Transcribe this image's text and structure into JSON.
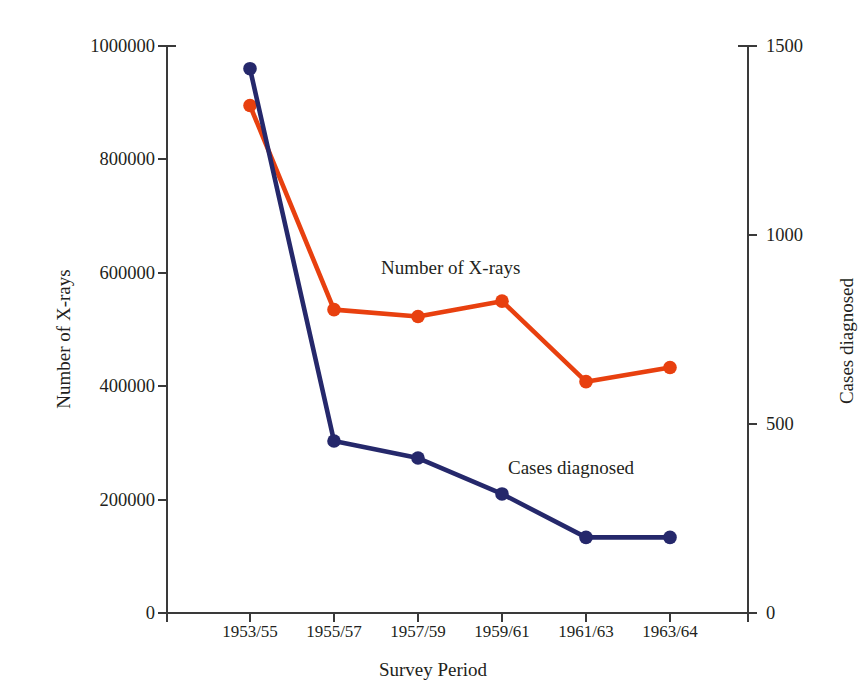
{
  "chart_data": {
    "type": "line",
    "title": "",
    "xlabel": "Survey Period",
    "ylabel": "Number of X-rays",
    "y2label": "Cases diagnosed",
    "categories": [
      "1953/55",
      "1955/57",
      "1957/59",
      "1959/61",
      "1961/63",
      "1963/64"
    ],
    "ylim": [
      0,
      1000000
    ],
    "y2lim": [
      0,
      1500
    ],
    "yticks": [
      "0",
      "200000",
      "400000",
      "600000",
      "800000",
      "1000000"
    ],
    "ytick_values": [
      0,
      200000,
      400000,
      600000,
      800000,
      1000000
    ],
    "y2ticks": [
      "0",
      "500",
      "1000",
      "1500"
    ],
    "y2tick_values": [
      0,
      500,
      1000,
      1500
    ],
    "grid": false,
    "legend": "inline-annotations",
    "series": [
      {
        "name": "Number of X-rays",
        "axis": "left",
        "color": "#e8400f",
        "label_text": "Number of X-rays",
        "values": [
          895000,
          535000,
          523000,
          550000,
          408000,
          433000
        ]
      },
      {
        "name": "Cases diagnosed",
        "axis": "right",
        "color": "#25286b",
        "label_text": "Cases diagnosed",
        "values": [
          1440,
          455,
          410,
          315,
          200,
          200
        ]
      }
    ]
  },
  "axes": {
    "left_title": "Number of X-rays",
    "right_title": "Cases diagnosed",
    "bottom_title": "Survey Period"
  },
  "colors": {
    "xrays": "#e8400f",
    "cases": "#25286b",
    "axis": "#3a3a3a",
    "text": "#231f20",
    "background": "#ffffff"
  }
}
